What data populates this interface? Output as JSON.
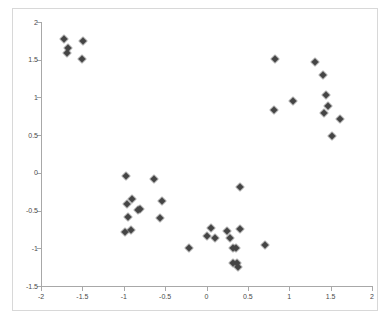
{
  "chart_data": {
    "type": "scatter",
    "title": "",
    "xlabel": "",
    "ylabel": "",
    "xlim": [
      -2,
      2
    ],
    "ylim": [
      -1.5,
      2
    ],
    "grid": false,
    "legend": "none",
    "marker": "diamond",
    "marker_color": "#404040",
    "axis_color": "#a8a8a8",
    "frame_color": "#d8d8d8",
    "background": "#ffffff",
    "xticks": [
      -2,
      -1.5,
      -1,
      -0.5,
      0,
      0.5,
      1,
      1.5,
      2
    ],
    "xtick_labels": [
      "-2",
      "-1.5",
      "-1",
      "-0.5",
      "0",
      "0.5",
      "1",
      "1.5",
      "2"
    ],
    "yticks": [
      2,
      1.5,
      1,
      0.5,
      0,
      -0.5,
      -1,
      -1.5
    ],
    "ytick_labels": [
      "2",
      "1.5",
      "1",
      "0.5",
      "0",
      "-0.5",
      "-1",
      "-1.5"
    ],
    "n_points": 42,
    "points": [
      {
        "x": -1.72,
        "y": 1.78
      },
      {
        "x": -1.67,
        "y": 1.65
      },
      {
        "x": -1.69,
        "y": 1.59
      },
      {
        "x": -1.49,
        "y": 1.75
      },
      {
        "x": -1.51,
        "y": 1.51
      },
      {
        "x": -0.97,
        "y": -0.04
      },
      {
        "x": -0.63,
        "y": -0.08
      },
      {
        "x": -0.96,
        "y": -0.41
      },
      {
        "x": -0.9,
        "y": -0.34
      },
      {
        "x": -0.83,
        "y": -0.49
      },
      {
        "x": -0.8,
        "y": -0.48
      },
      {
        "x": -0.54,
        "y": -0.37
      },
      {
        "x": -0.95,
        "y": -0.59
      },
      {
        "x": -0.56,
        "y": -0.6
      },
      {
        "x": -0.99,
        "y": -0.79
      },
      {
        "x": -0.91,
        "y": -0.76
      },
      {
        "x": -0.21,
        "y": -1.0
      },
      {
        "x": 0.0,
        "y": -0.84
      },
      {
        "x": 0.05,
        "y": -0.73
      },
      {
        "x": 0.1,
        "y": -0.87
      },
      {
        "x": 0.25,
        "y": -0.77
      },
      {
        "x": 0.29,
        "y": -0.86
      },
      {
        "x": 0.4,
        "y": -0.74
      },
      {
        "x": 0.41,
        "y": -0.19
      },
      {
        "x": 0.32,
        "y": -1.0
      },
      {
        "x": 0.36,
        "y": -1.0
      },
      {
        "x": 0.32,
        "y": -1.19
      },
      {
        "x": 0.37,
        "y": -1.2
      },
      {
        "x": 0.38,
        "y": -1.25
      },
      {
        "x": 0.71,
        "y": -0.96
      },
      {
        "x": 0.83,
        "y": 1.51
      },
      {
        "x": 0.82,
        "y": 0.83
      },
      {
        "x": 1.05,
        "y": 0.95
      },
      {
        "x": 1.31,
        "y": 1.47
      },
      {
        "x": 1.41,
        "y": 1.3
      },
      {
        "x": 1.44,
        "y": 1.03
      },
      {
        "x": 1.47,
        "y": 0.88
      },
      {
        "x": 1.42,
        "y": 0.8
      },
      {
        "x": 1.61,
        "y": 0.72
      },
      {
        "x": 1.52,
        "y": 0.49
      }
    ]
  },
  "figure": {
    "name": "scatter-plot"
  }
}
